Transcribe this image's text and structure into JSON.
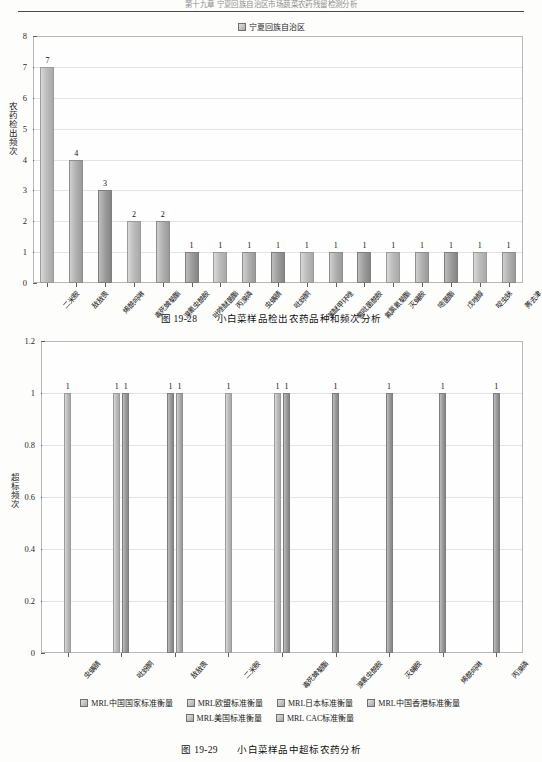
{
  "header": {
    "running_title": "第十九章 宁夏回族自治区市场蔬菜农药残留检测分析"
  },
  "figure1": {
    "legend": [
      {
        "label": "宁夏回族自治区"
      }
    ],
    "caption_number": "图 19-28",
    "caption_text": "小白菜样品检出农药品种和频次分析",
    "chart_data": {
      "type": "bar",
      "title": "小白菜样品检出农药品种和频次分析",
      "xlabel": "",
      "ylabel": "农药检出频次",
      "ylim": [
        0,
        8
      ],
      "yticks": [
        "0",
        "1",
        "2",
        "3",
        "4",
        "5",
        "6",
        "7",
        "8"
      ],
      "grid": true,
      "legend_position": "top-center",
      "series_name": "宁夏回族自治区",
      "categories": [
        "二米胺",
        "敌敌畏",
        "烯酰吗啉",
        "毒死蜱菊酯",
        "溴氰虫酰胺",
        "吡唑醚菌酯",
        "丙溴磷",
        "虫螨腈",
        "吡蚜酮",
        "苯醚甲环唑",
        "氟吡菌酰胺",
        "氟氯氰菊酯",
        "灭蝇胺",
        "嘧菌酯",
        "戊唑醇",
        "啶虫脒",
        "莠去津"
      ],
      "values": [
        7,
        4,
        3,
        2,
        2,
        1,
        1,
        1,
        1,
        1,
        1,
        1,
        1,
        1,
        1,
        1,
        1
      ],
      "data_labels": [
        "7",
        "4",
        "3",
        "2",
        "2",
        "1",
        "1",
        "1",
        "1",
        "1",
        "1",
        "1",
        "1",
        "1",
        "1",
        "1",
        "1"
      ]
    }
  },
  "figure2": {
    "caption_number": "图 19-29",
    "caption_text": "小白菜样品中超标农药分析",
    "legend": [
      {
        "label": "MRL中国国家标准衡量"
      },
      {
        "label": "MRL欧盟标准衡量"
      },
      {
        "label": "MRL日本标准衡量"
      },
      {
        "label": "MRL中国香港标准衡量"
      },
      {
        "label": "MRL美国标准衡量"
      },
      {
        "label": "MRL CAC标准衡量"
      }
    ],
    "chart_data": {
      "type": "bar",
      "title": "小白菜样品中超标农药分析",
      "xlabel": "",
      "ylabel": "超标频次",
      "ylim": [
        0,
        1.2
      ],
      "yticks": [
        "0",
        "0.2",
        "0.4",
        "0.6",
        "0.8",
        "1",
        "1.2"
      ],
      "grid": true,
      "legend_position": "bottom-center",
      "categories": [
        "虫螨腈",
        "吡蚜酮",
        "敌敌畏",
        "二米胺",
        "毒死蜱菊酯",
        "溴氰虫酰胺",
        "灭蝇胺",
        "烯酰吗啉",
        "丙溴磷"
      ],
      "series": [
        {
          "name": "MRL中国国家标准衡量",
          "values": [
            1,
            1,
            0,
            1,
            1,
            0,
            0,
            0,
            0
          ]
        },
        {
          "name": "MRL欧盟标准衡量",
          "values": [
            0,
            1,
            1,
            0,
            1,
            1,
            1,
            1,
            1
          ]
        },
        {
          "name": "MRL日本标准衡量",
          "values": [
            0,
            0,
            1,
            0,
            0,
            0,
            0,
            0,
            0
          ]
        },
        {
          "name": "MRL中国香港标准衡量",
          "values": [
            0,
            0,
            0,
            0,
            0,
            0,
            0,
            0,
            0
          ]
        },
        {
          "name": "MRL美国标准衡量",
          "values": [
            0,
            0,
            0,
            0,
            0,
            0,
            0,
            0,
            0
          ]
        },
        {
          "name": "MRL CAC标准衡量",
          "values": [
            0,
            0,
            0,
            0,
            0,
            0,
            0,
            0,
            0
          ]
        }
      ],
      "bar_labels": [
        {
          "group": 0,
          "labels": [
            "1"
          ]
        },
        {
          "group": 1,
          "labels": [
            "1",
            "1"
          ]
        },
        {
          "group": 2,
          "labels": [
            "1",
            "1"
          ]
        },
        {
          "group": 3,
          "labels": [
            "1",
            "1"
          ]
        },
        {
          "group": 4,
          "labels": [
            "1",
            "1"
          ]
        },
        {
          "group": 5,
          "labels": [
            "1"
          ]
        },
        {
          "group": 6,
          "labels": [
            "1"
          ]
        },
        {
          "group": 7,
          "labels": [
            "1"
          ]
        },
        {
          "group": 8,
          "labels": [
            "1"
          ]
        }
      ]
    }
  }
}
